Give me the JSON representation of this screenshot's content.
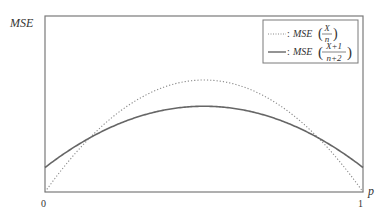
{
  "chart_data": {
    "type": "line",
    "title": "",
    "xlabel": "p",
    "ylabel": "MSE",
    "x_ticks": [
      "0",
      "1"
    ],
    "xlim": [
      0,
      1
    ],
    "ylim": [
      0,
      0.028
    ],
    "grid": false,
    "legend_position": "upper right",
    "n": 14,
    "x": [
      0,
      0.05,
      0.1,
      0.15,
      0.2,
      0.25,
      0.3,
      0.35,
      0.4,
      0.45,
      0.5,
      0.55,
      0.6,
      0.65,
      0.7,
      0.75,
      0.8,
      0.85,
      0.9,
      0.95,
      1
    ],
    "series": [
      {
        "name": "MSE(X/n)",
        "style": "dotted",
        "values": [
          0,
          0.00339,
          0.00643,
          0.00911,
          0.01143,
          0.01339,
          0.015,
          0.01625,
          0.01714,
          0.01768,
          0.01786,
          0.01768,
          0.01714,
          0.01625,
          0.015,
          0.01339,
          0.01143,
          0.00911,
          0.00643,
          0.00339,
          0
        ]
      },
      {
        "name": "MSE((X+1)/(n+2))",
        "style": "solid",
        "values": [
          0.00391,
          0.00502,
          0.00602,
          0.00691,
          0.00766,
          0.0083,
          0.00883,
          0.00923,
          0.00953,
          0.0097,
          0.00977,
          0.0097,
          0.00953,
          0.00923,
          0.00883,
          0.0083,
          0.00766,
          0.00691,
          0.00602,
          0.00502,
          0.00391
        ]
      }
    ]
  },
  "labels": {
    "y_axis": "MSE",
    "x_axis": "p",
    "tick_0": "0",
    "tick_1": "1"
  },
  "legend": {
    "entry1": {
      "marker": "dotted",
      "prefix": ": MSE",
      "num": "X",
      "den": "n"
    },
    "entry2": {
      "marker": "solid",
      "prefix": ": MSE",
      "num": "X+1",
      "den": "n+2"
    }
  },
  "colors": {
    "axis": "#7a7a7a",
    "dotted": "#8a8a8a",
    "solid": "#666666",
    "text": "#333333"
  }
}
